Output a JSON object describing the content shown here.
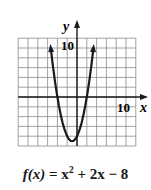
{
  "chart_data": {
    "type": "line",
    "title": "",
    "function": "f(x) = x^2 + 2x - 8",
    "xlabel": "x",
    "ylabel": "y",
    "xlim": [
      -12,
      12
    ],
    "ylim": [
      -10,
      12
    ],
    "grid": true,
    "grid_step": 2,
    "tick_labels": {
      "x": [
        "10"
      ],
      "y": [
        "10"
      ]
    },
    "vertex": [
      -1,
      -9
    ],
    "x_intercepts": [
      -4,
      2
    ],
    "y_intercept": -8,
    "x": [
      -5.3,
      -5,
      -4,
      -3,
      -2,
      -1,
      0,
      1,
      2,
      3,
      3.3
    ],
    "y": [
      9.5,
      7,
      0,
      -5,
      -8,
      -9,
      -8,
      -5,
      0,
      7,
      9.5
    ]
  },
  "labels": {
    "x_axis": "x",
    "y_axis": "y",
    "x_tick": "10",
    "y_tick": "10",
    "caption_func": "f(x)",
    "caption_eq": " = x",
    "caption_exp": "2",
    "caption_rest": " + 2x − 8"
  },
  "colors": {
    "grid": "#8a8a8a",
    "axis": "#1a1a1a",
    "curve": "#1a1a1a"
  }
}
